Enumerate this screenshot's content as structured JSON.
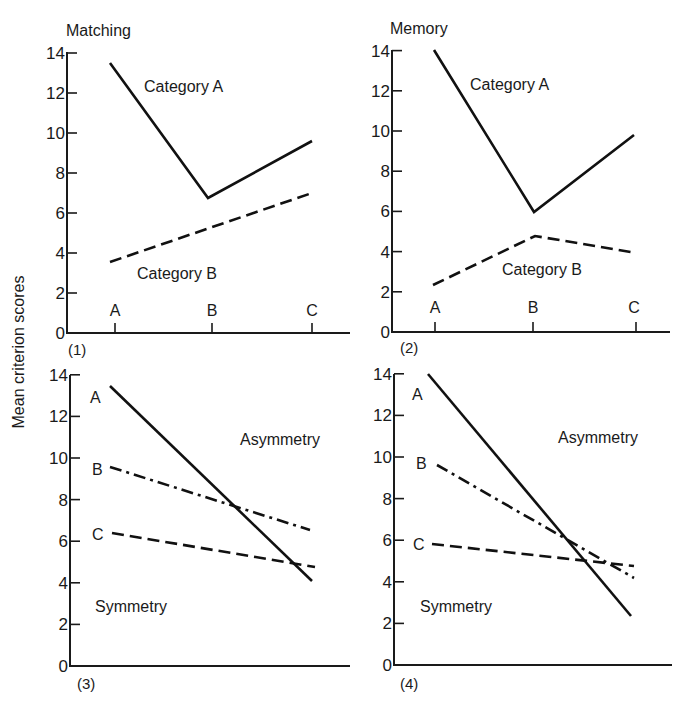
{
  "figure": {
    "ylabel": "Mean criterion scores",
    "yticks": [
      "0",
      "2",
      "4",
      "6",
      "8",
      "10",
      "12",
      "14"
    ]
  },
  "chart_data": [
    {
      "type": "line",
      "panel": "(1)",
      "title": "Matching",
      "xlabel": "",
      "ylabel": "Mean criterion scores",
      "ylim": [
        0,
        14
      ],
      "categories": [
        "A",
        "B",
        "C"
      ],
      "series": [
        {
          "name": "Category A",
          "style": "solid",
          "values": [
            13.5,
            6.8,
            9.6
          ]
        },
        {
          "name": "Category B",
          "style": "dashed",
          "values": [
            3.6,
            5.3,
            7.0
          ]
        }
      ],
      "grid": false
    },
    {
      "type": "line",
      "panel": "(2)",
      "title": "Memory",
      "xlabel": "",
      "ylabel": "Mean criterion scores",
      "ylim": [
        0,
        14
      ],
      "categories": [
        "A",
        "B",
        "C"
      ],
      "series": [
        {
          "name": "Category A",
          "style": "solid",
          "values": [
            14.0,
            6.0,
            9.8
          ]
        },
        {
          "name": "Category B",
          "style": "dashed",
          "values": [
            2.3,
            4.8,
            4.0
          ]
        }
      ],
      "grid": false
    },
    {
      "type": "line",
      "panel": "(3)",
      "title": "",
      "xlabel": "",
      "ylabel": "Mean criterion scores",
      "ylim": [
        0,
        14
      ],
      "categories": [
        "Symmetry",
        "Asymmetry"
      ],
      "series": [
        {
          "name": "A",
          "style": "solid",
          "values": [
            13.5,
            3.8
          ]
        },
        {
          "name": "B",
          "style": "dash-dot",
          "values": [
            9.6,
            6.5
          ]
        },
        {
          "name": "C",
          "style": "dashed",
          "values": [
            6.3,
            4.6
          ]
        }
      ],
      "annotations": [
        "Asymmetry",
        "Symmetry"
      ],
      "grid": false
    },
    {
      "type": "line",
      "panel": "(4)",
      "title": "",
      "xlabel": "",
      "ylabel": "Mean criterion scores",
      "ylim": [
        0,
        14
      ],
      "categories": [
        "Symmetry",
        "Asymmetry"
      ],
      "series": [
        {
          "name": "A",
          "style": "solid",
          "values": [
            14.0,
            2.2
          ]
        },
        {
          "name": "B",
          "style": "dash-dot",
          "values": [
            9.7,
            3.9
          ]
        },
        {
          "name": "C",
          "style": "dashed",
          "values": [
            5.6,
            4.5
          ]
        }
      ],
      "annotations": [
        "Asymmetry",
        "Symmetry"
      ],
      "grid": false
    }
  ]
}
